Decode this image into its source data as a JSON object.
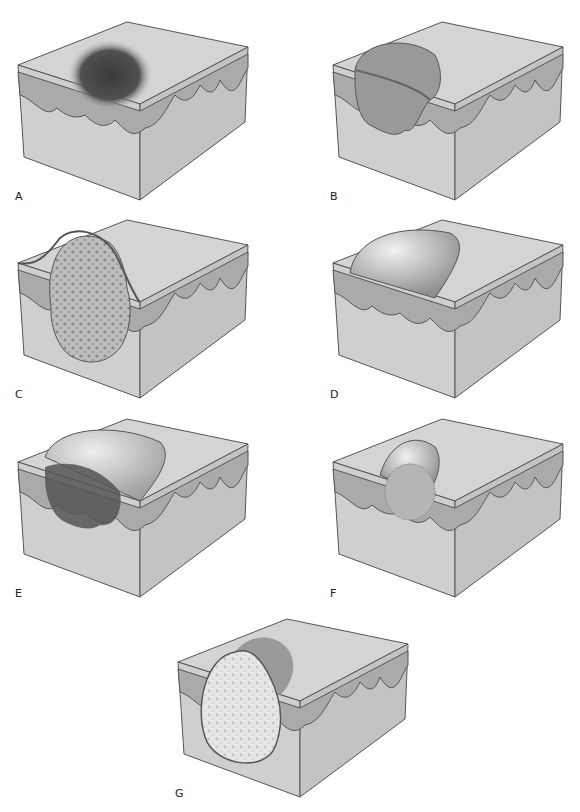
{
  "figure": {
    "panels": [
      {
        "id": "A",
        "label": "A",
        "lesion": "flat pigmented macule"
      },
      {
        "id": "B",
        "label": "B",
        "lesion": "raised flat-topped plaque/papule"
      },
      {
        "id": "C",
        "label": "C",
        "lesion": "irregular textured nodule/tumor"
      },
      {
        "id": "D",
        "label": "D",
        "lesion": "fluid-filled vesicle/bulla"
      },
      {
        "id": "E",
        "label": "E",
        "lesion": "dome with dark dermal mass"
      },
      {
        "id": "F",
        "label": "F",
        "lesion": "small elevated nodule"
      },
      {
        "id": "G",
        "label": "G",
        "lesion": "pus-filled pustule/cyst"
      }
    ]
  },
  "colors": {
    "background": "#ffffff",
    "block_front": "#cfcfcf",
    "block_side": "#c2c2c2",
    "block_top": "#d6d6d6",
    "epidermis": "#a9a9a9",
    "outline": "#555555",
    "lesion_dark": "#4a4a4a",
    "lesion_mid": "#8e8e8e"
  }
}
